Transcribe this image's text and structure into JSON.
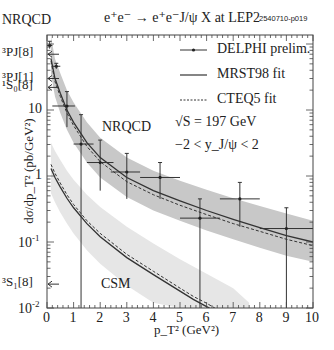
{
  "header": {
    "corner_label": "NRQCD",
    "title": "e⁺e⁻ → e⁺e⁻J/ψ X at LEP2",
    "figure_tag": "2540710-p019"
  },
  "axes": {
    "xlabel": "p_T² (GeV²)",
    "ylabel": "dσ/dp_T² (pb/GeV²)",
    "x_ticks": [
      "0",
      "1",
      "2",
      "3",
      "4",
      "5",
      "6",
      "7",
      "8",
      "9",
      "10"
    ],
    "y_ticks": [
      {
        "label": "10",
        "exp": "-2",
        "value": 0.01
      },
      {
        "label": "10",
        "exp": "-1",
        "value": 0.1
      },
      {
        "label": "1",
        "exp": "",
        "value": 1
      },
      {
        "label": "10",
        "exp": "",
        "value": 10
      }
    ]
  },
  "legend": {
    "items": [
      {
        "label": "DELPHI prelim.",
        "style": "data-point"
      },
      {
        "label": "MRST98 fit",
        "style": "solid"
      },
      {
        "label": "CTEQ5 fit",
        "style": "dotted"
      }
    ],
    "sqrt_s": "√S = 197 GeV",
    "rapidity": "−2 < y_J/ψ < 2"
  },
  "annotations": {
    "nrqcd_band_label": "NRQCD",
    "csm_band_label": "CSM",
    "states": [
      {
        "label": "³P_J^[8]",
        "value": 70
      },
      {
        "label": "³P_J^[1]",
        "value": 30
      },
      {
        "label": "¹S₀^[8]",
        "value": 22
      },
      {
        "label": "³S₁^[8]",
        "value": 0.023
      }
    ]
  },
  "colors": {
    "nrqcd_band": "#c8c8c8",
    "csm_band": "#e6e6e6",
    "line": "#333333",
    "axis": "#444444"
  },
  "chart_data": {
    "type": "scatter",
    "xlabel": "pT² (GeV²)",
    "ylabel": "dσ/dpT² (pb/GeV²)",
    "xlim": [
      0,
      10
    ],
    "ylim": [
      0.01,
      135
    ],
    "yscale": "log",
    "legend_position": "upper right",
    "series": [
      {
        "name": "DELPHI prelim.",
        "kind": "points_with_errors",
        "points": [
          {
            "x": 0.75,
            "y": 11.5,
            "xlo": 0.2,
            "xhi": 1.05,
            "ylo": 5.5,
            "yhi": 19
          },
          {
            "x": 1.28,
            "y": 3.05,
            "xlo": 1.0,
            "xhi": 1.75,
            "ylo": 0.01,
            "yhi": 8.5
          },
          {
            "x": 2.0,
            "y": 1.6,
            "xlo": 1.5,
            "xhi": 2.5,
            "ylo": 0.6,
            "yhi": 3.5
          },
          {
            "x": 3.0,
            "y": 1.15,
            "xlo": 2.4,
            "xhi": 3.5,
            "ylo": 0.45,
            "yhi": 2.2
          },
          {
            "x": 4.25,
            "y": 0.95,
            "xlo": 3.5,
            "xhi": 5.0,
            "ylo": 0.45,
            "yhi": 1.6
          },
          {
            "x": 5.75,
            "y": 0.23,
            "xlo": 5.0,
            "xhi": 6.5,
            "ylo": 0.01,
            "yhi": 0.45
          },
          {
            "x": 7.25,
            "y": 0.45,
            "xlo": 6.5,
            "xhi": 8.0,
            "ylo": 0.17,
            "yhi": 0.8
          },
          {
            "x": 9.0,
            "y": 0.16,
            "xlo": 8.0,
            "xhi": 10.0,
            "ylo": 0.01,
            "yhi": 0.33
          }
        ]
      },
      {
        "name": "NRQCD MRST98 fit",
        "kind": "line_solid",
        "x": [
          0.15,
          0.3,
          0.5,
          0.75,
          1.0,
          1.5,
          2.0,
          3.0,
          4.0,
          5.0,
          6.0,
          7.0,
          8.0,
          9.0,
          10.0
        ],
        "y": [
          60,
          30,
          18,
          10,
          6.5,
          3.2,
          1.9,
          0.95,
          0.6,
          0.42,
          0.3,
          0.22,
          0.165,
          0.125,
          0.1
        ]
      },
      {
        "name": "NRQCD CTEQ5 fit",
        "kind": "line_dotted",
        "x": [
          0.15,
          0.3,
          0.5,
          0.75,
          1.0,
          1.5,
          2.0,
          3.0,
          4.0,
          5.0,
          6.0,
          7.0,
          8.0,
          9.0,
          10.0
        ],
        "y": [
          55,
          27,
          16,
          9,
          5.8,
          2.8,
          1.65,
          0.82,
          0.52,
          0.36,
          0.26,
          0.19,
          0.145,
          0.11,
          0.088
        ]
      },
      {
        "name": "NRQCD band",
        "kind": "band",
        "x": [
          0.15,
          0.3,
          0.5,
          0.75,
          1.0,
          1.5,
          2.0,
          3.0,
          4.0,
          5.0,
          6.0,
          7.0,
          8.0,
          9.0,
          10.0
        ],
        "ylo": [
          35,
          16,
          9,
          5,
          3.2,
          1.6,
          0.95,
          0.48,
          0.3,
          0.21,
          0.15,
          0.11,
          0.082,
          0.062,
          0.05
        ],
        "yhi": [
          130,
          60,
          36,
          20,
          13,
          6.5,
          3.8,
          1.9,
          1.2,
          0.85,
          0.62,
          0.46,
          0.35,
          0.27,
          0.21
        ]
      },
      {
        "name": "CSM MRST98 fit",
        "kind": "line_solid",
        "x": [
          0.15,
          0.3,
          0.5,
          0.75,
          1.0,
          1.5,
          2.0,
          3.0,
          4.0,
          5.0,
          5.5,
          6.0,
          6.3
        ],
        "y": [
          1.3,
          0.95,
          0.68,
          0.46,
          0.33,
          0.19,
          0.12,
          0.058,
          0.032,
          0.018,
          0.0135,
          0.0105,
          0.009
        ]
      },
      {
        "name": "CSM CTEQ5 fit",
        "kind": "line_dotted",
        "x": [
          0.15,
          0.3,
          0.5,
          0.75,
          1.0,
          1.5,
          2.0,
          3.0,
          4.0,
          5.0,
          5.5,
          6.0,
          6.5
        ],
        "y": [
          1.5,
          1.1,
          0.78,
          0.52,
          0.37,
          0.21,
          0.135,
          0.065,
          0.036,
          0.02,
          0.015,
          0.0118,
          0.009
        ]
      },
      {
        "name": "CSM band",
        "kind": "band",
        "x": [
          0.15,
          0.3,
          0.5,
          0.75,
          1.0,
          1.5,
          2.0,
          3.0,
          4.0,
          5.0,
          6.0,
          7.0,
          7.6
        ],
        "ylo": [
          0.55,
          0.4,
          0.28,
          0.19,
          0.135,
          0.075,
          0.047,
          0.022,
          0.012,
          0.01,
          0.01,
          0.01,
          0.01
        ],
        "yhi": [
          3.2,
          2.4,
          1.75,
          1.2,
          0.88,
          0.52,
          0.34,
          0.17,
          0.095,
          0.055,
          0.033,
          0.02,
          0.012
        ]
      },
      {
        "name": "Low-pT points",
        "kind": "points_with_errors",
        "points": [
          {
            "x": 0.1,
            "y": 95,
            "xlo": 0.0,
            "xhi": 0.2,
            "ylo": 85,
            "yhi": 110
          },
          {
            "x": 0.35,
            "y": 46,
            "xlo": 0.2,
            "xhi": 0.5,
            "ylo": 42,
            "yhi": 51
          }
        ]
      }
    ]
  }
}
